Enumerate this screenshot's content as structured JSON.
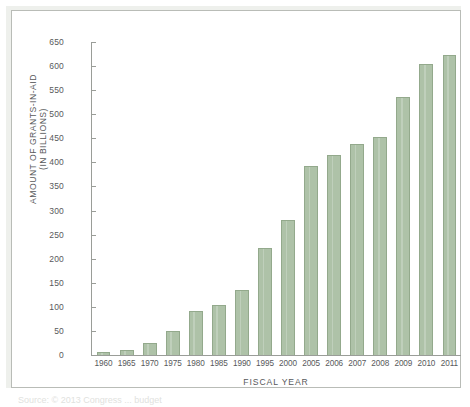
{
  "chart_data": {
    "type": "bar",
    "title": "",
    "xlabel": "FISCAL YEAR",
    "ylabel_line1": "AMOUNT OF GRANTS-IN-AID",
    "ylabel_line2": "(IN BILLIONS)",
    "categories": [
      "1960",
      "1965",
      "1970",
      "1975",
      "1980",
      "1985",
      "1990",
      "1995",
      "2000",
      "2005",
      "2006",
      "2007",
      "2008",
      "2009",
      "2010",
      "2011"
    ],
    "values": [
      7,
      11,
      24,
      50,
      91,
      104,
      134,
      222,
      281,
      393,
      416,
      438,
      452,
      536,
      605,
      622
    ],
    "ylim": [
      0,
      650
    ],
    "yticks": [
      0,
      50,
      100,
      150,
      200,
      250,
      300,
      350,
      400,
      450,
      500,
      550,
      600,
      650
    ],
    "grid": false,
    "legend": "none",
    "bar_color": "#aec2a8",
    "bar_border_color": "#93a98c",
    "axis_color": "#9a9d98",
    "frame_border_color": "#b9bcb7"
  },
  "caption": {
    "text": "Source: © 2013 Congress ... budget"
  }
}
